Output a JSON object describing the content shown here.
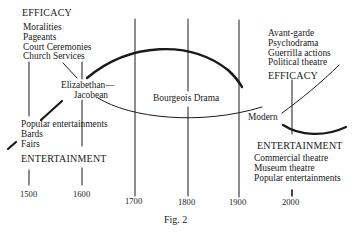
{
  "figure": {
    "caption": "Fig. 2",
    "type": "braid diagram of efficacy vs. entertainment in theatre history"
  },
  "timeline": {
    "years": [
      "1500",
      "1600",
      "1700",
      "1800",
      "1900",
      "2000"
    ]
  },
  "top_left": {
    "heading": "EFFICACY",
    "items": [
      "Moralities",
      "Pageants",
      "Court Ceremonies",
      "Church Services"
    ]
  },
  "bottom_left": {
    "items": [
      "Popular entertainments",
      "Bards",
      "Fairs"
    ],
    "heading": "ENTERTAINMENT"
  },
  "periods": {
    "elizabethan_line1": "Elizabethan—",
    "elizabethan_line2": "Jacobean",
    "bourgeois": "Bourgeois Drama",
    "modern": "Modern"
  },
  "top_right": {
    "items": [
      "Avant-garde",
      "Psychodrama",
      "Guerrilla actions",
      "Political theatre"
    ],
    "heading": "EFFICACY"
  },
  "bottom_right": {
    "heading": "ENTERTAINMENT",
    "items": [
      "Commercial theatre",
      "Museum theatre",
      "Popular entertainments"
    ]
  },
  "colors": {
    "ink": "#1a1a1a",
    "paper": "#ffffff"
  }
}
